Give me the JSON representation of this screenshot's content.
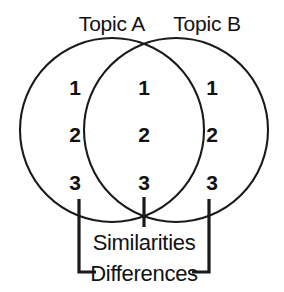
{
  "diagram": {
    "type": "venn",
    "title_left": "Topic A",
    "title_right": "Topic B",
    "stroke_color": "#1a1a1a",
    "text_color": "#111111",
    "background_color": "#ffffff",
    "sets": {
      "left_only": {
        "label": "Topic A",
        "items": [
          "1",
          "2",
          "3"
        ]
      },
      "intersection": {
        "label": "Similarities",
        "items": [
          "1",
          "2",
          "3"
        ]
      },
      "right_only": {
        "label": "Topic B",
        "items": [
          "1",
          "2",
          "3"
        ]
      }
    },
    "annotations": {
      "center_bracket_label": "Similarities",
      "outer_bracket_label": "Differences"
    }
  }
}
